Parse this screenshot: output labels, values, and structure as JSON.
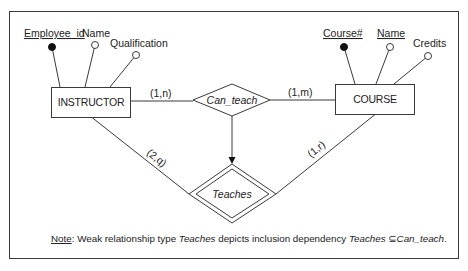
{
  "diagram": {
    "type": "er-diagram",
    "colors": {
      "stroke": "#3a3a3a",
      "text": "#222222",
      "background": "#ffffff"
    },
    "entities": [
      {
        "name": "INSTRUCTOR",
        "attributes": [
          {
            "name": "Employee_id",
            "key": true
          },
          {
            "name": "Name",
            "key": false
          },
          {
            "name": "Qualification",
            "key": false
          }
        ]
      },
      {
        "name": "COURSE",
        "attributes": [
          {
            "name": "Course#",
            "key": true
          },
          {
            "name": "Name",
            "key": true,
            "underlined": true
          },
          {
            "name": "Credits",
            "key": false
          }
        ]
      }
    ],
    "relationships": [
      {
        "name": "Can_teach",
        "weak": false
      },
      {
        "name": "Teaches",
        "weak": true
      }
    ],
    "cardinalities": {
      "instructor_can_teach": "(1,n)",
      "course_can_teach": "(1,m)",
      "instructor_teaches": "(2,q)",
      "course_teaches": "(1,r)"
    },
    "note": {
      "label": "Note",
      "colon": ":",
      "part1": " Weak relationship type ",
      "term1": "Teaches",
      "part2": " depicts inclusion dependency ",
      "term2": "Teaches",
      "subset_symbol": " ⊆",
      "term3": "Can_teach",
      "end": "."
    }
  }
}
